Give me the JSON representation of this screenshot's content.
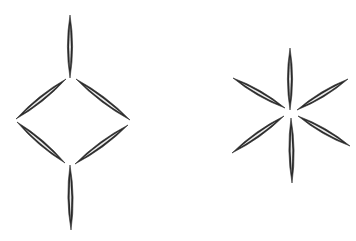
{
  "diagram": {
    "background": "#ffffff",
    "stroke_color": "#2a2a2a",
    "figures": [
      {
        "name": "diamond-structure",
        "description": "Six spindle-shaped strokes arranged as a diamond (rhombus) with vertical spindles above and below",
        "spindles": [
          {
            "name": "top-vertical",
            "x1": 70,
            "y1": 15,
            "x2": 70,
            "y2": 78,
            "w": 2.6
          },
          {
            "name": "upper-left",
            "x1": 66,
            "y1": 79,
            "x2": 16,
            "y2": 119,
            "w": 2.6
          },
          {
            "name": "upper-right",
            "x1": 76,
            "y1": 79,
            "x2": 130,
            "y2": 120,
            "w": 2.6
          },
          {
            "name": "lower-left",
            "x1": 17,
            "y1": 122,
            "x2": 65,
            "y2": 163,
            "w": 2.6
          },
          {
            "name": "lower-right",
            "x1": 128,
            "y1": 125,
            "x2": 75,
            "y2": 164,
            "w": 2.6
          },
          {
            "name": "bottom-vertical",
            "x1": 70,
            "y1": 165,
            "x2": 71,
            "y2": 230,
            "w": 2.6
          }
        ]
      },
      {
        "name": "star-structure",
        "description": "Six spindle-shaped strokes radiating from a common center like an asterisk",
        "spindles": [
          {
            "name": "top",
            "x1": 290,
            "y1": 48,
            "x2": 290,
            "y2": 110,
            "w": 2.6
          },
          {
            "name": "bottom",
            "x1": 291,
            "y1": 118,
            "x2": 292,
            "y2": 183,
            "w": 2.6
          },
          {
            "name": "upper-left",
            "x1": 233,
            "y1": 78,
            "x2": 285,
            "y2": 108,
            "w": 2.6
          },
          {
            "name": "upper-right",
            "x1": 348,
            "y1": 79,
            "x2": 297,
            "y2": 110,
            "w": 2.6
          },
          {
            "name": "lower-left",
            "x1": 232,
            "y1": 153,
            "x2": 284,
            "y2": 116,
            "w": 2.6
          },
          {
            "name": "lower-right",
            "x1": 298,
            "y1": 116,
            "x2": 350,
            "y2": 146,
            "w": 2.6
          }
        ]
      }
    ]
  }
}
